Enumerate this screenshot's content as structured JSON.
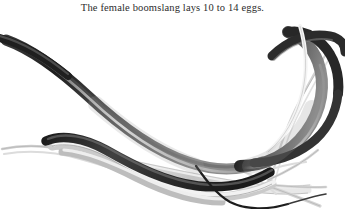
{
  "page": {
    "background_color": "#ffffff",
    "width": 345,
    "height": 209
  },
  "caption": {
    "text": "The female boomslang lays 10 to 14 eggs.",
    "color": "#2c2c2c",
    "align": "center"
  },
  "illustration": {
    "name": "boomslang-snake-on-branch",
    "subject": "boomslang snake coiled along a tree branch",
    "style": "monochrome pen-and-ink / grayscale wash drawing",
    "snake_color_dark": "#242424",
    "snake_color_mid": "#6e6e6e",
    "snake_color_light": "#b8b8b8",
    "branch_color": "#c9c9c9",
    "branch_outline_color": "#a0a0a0",
    "background_color": "#ffffff",
    "parts": [
      {
        "name": "snake-upper-body",
        "description": "dark body entering from upper-left, tapering toward the left edge"
      },
      {
        "name": "snake-mid-coil",
        "description": "broad sweeping loop crossing the center of the frame"
      },
      {
        "name": "snake-right-loop",
        "description": "body looping over and under the branch at the right"
      },
      {
        "name": "snake-tail",
        "description": "thin dark tail curving down to the lower-right"
      },
      {
        "name": "branch-main",
        "description": "pale horizontal branch the snake rests upon"
      },
      {
        "name": "branch-fork-right",
        "description": "forked twigs radiating at the lower right"
      },
      {
        "name": "branch-twig-left",
        "description": "thin pale twig at the left edge"
      },
      {
        "name": "branch-twig-upper-right",
        "description": "pale twig rising at the upper right"
      }
    ]
  }
}
